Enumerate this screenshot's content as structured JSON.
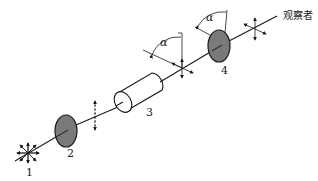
{
  "diagram": {
    "type": "optical-path-schematic",
    "components": [
      {
        "id": "1",
        "label": "1",
        "kind": "light-source"
      },
      {
        "id": "2",
        "label": "2",
        "kind": "polarizer"
      },
      {
        "id": "3",
        "label": "3",
        "kind": "sample-tube"
      },
      {
        "id": "4",
        "label": "4",
        "kind": "analyzer"
      }
    ],
    "angle_labels": [
      "α",
      "α"
    ],
    "observer_label": "观察者",
    "colors": {
      "line": "#1a1a1a",
      "polarizer_fill": "#7a7a7a",
      "background": "#ffffff"
    }
  }
}
